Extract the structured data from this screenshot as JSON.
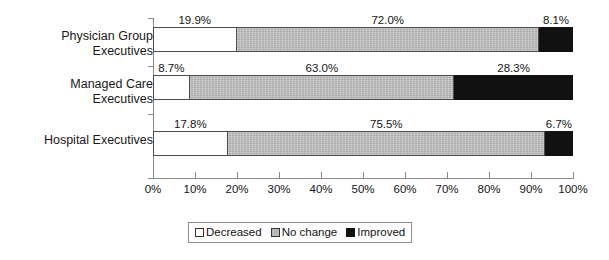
{
  "chart_data": {
    "type": "bar",
    "orientation": "horizontal",
    "stacked": true,
    "stack_mode": "percent",
    "title": "",
    "subtitle": "",
    "xlabel": "",
    "ylabel": "",
    "xlim": [
      0,
      100
    ],
    "grid": false,
    "legend_position": "bottom",
    "categories": [
      "Physician Group\nExecutives",
      "Managed Care\nExecutives",
      "Hospital Executives"
    ],
    "category_lines": [
      [
        "Physician Group",
        "Executives"
      ],
      [
        "Managed Care",
        "Executives"
      ],
      [
        "Hospital Executives"
      ]
    ],
    "series": [
      {
        "name": "Decreased",
        "color": "#ffffff",
        "values": [
          19.9,
          8.7,
          17.8
        ]
      },
      {
        "name": "No change",
        "color": "#b9b9b9",
        "values": [
          72.0,
          63.0,
          75.5
        ]
      },
      {
        "name": "Improved",
        "color": "#111111",
        "values": [
          8.1,
          28.3,
          6.7
        ]
      }
    ],
    "data_labels": [
      [
        "19.9%",
        "72.0%",
        "8.1%"
      ],
      [
        "8.7%",
        "63.0%",
        "28.3%"
      ],
      [
        "17.8%",
        "75.5%",
        "6.7%"
      ]
    ],
    "xticks": [
      0,
      10,
      20,
      30,
      40,
      50,
      60,
      70,
      80,
      90,
      100
    ],
    "xtick_labels": [
      "0%",
      "10%",
      "20%",
      "30%",
      "40%",
      "50%",
      "60%",
      "70%",
      "80%",
      "90%",
      "100%"
    ]
  },
  "legend": {
    "items": [
      {
        "label": "Decreased",
        "swatch": "white-square-icon"
      },
      {
        "label": "No change",
        "swatch": "gray-square-icon"
      },
      {
        "label": "Improved",
        "swatch": "black-square-icon"
      }
    ]
  }
}
